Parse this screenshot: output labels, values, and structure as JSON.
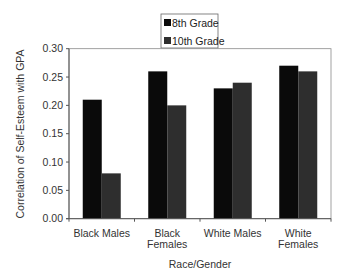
{
  "chart_data": {
    "type": "bar",
    "title": "",
    "xlabel": "Race/Gender",
    "ylabel": "Correlation of Self-Esteem with GPA",
    "categories": [
      "Black Males",
      "Black Females",
      "White Males",
      "White Females"
    ],
    "category_lines": [
      [
        "Black Males"
      ],
      [
        "Black",
        "Females"
      ],
      [
        "White Males"
      ],
      [
        "White",
        "Females"
      ]
    ],
    "series": [
      {
        "name": "8th Grade",
        "values": [
          0.21,
          0.26,
          0.23,
          0.27
        ],
        "color": "#0a0a0a"
      },
      {
        "name": "10th Grade",
        "values": [
          0.08,
          0.2,
          0.24,
          0.26
        ],
        "color": "#2e2e2e"
      }
    ],
    "ylim": [
      0.0,
      0.3
    ],
    "yticks": [
      "0.00",
      "0.05",
      "0.10",
      "0.15",
      "0.20",
      "0.25",
      "0.30"
    ],
    "grid": false,
    "legend_position": "top-center"
  }
}
